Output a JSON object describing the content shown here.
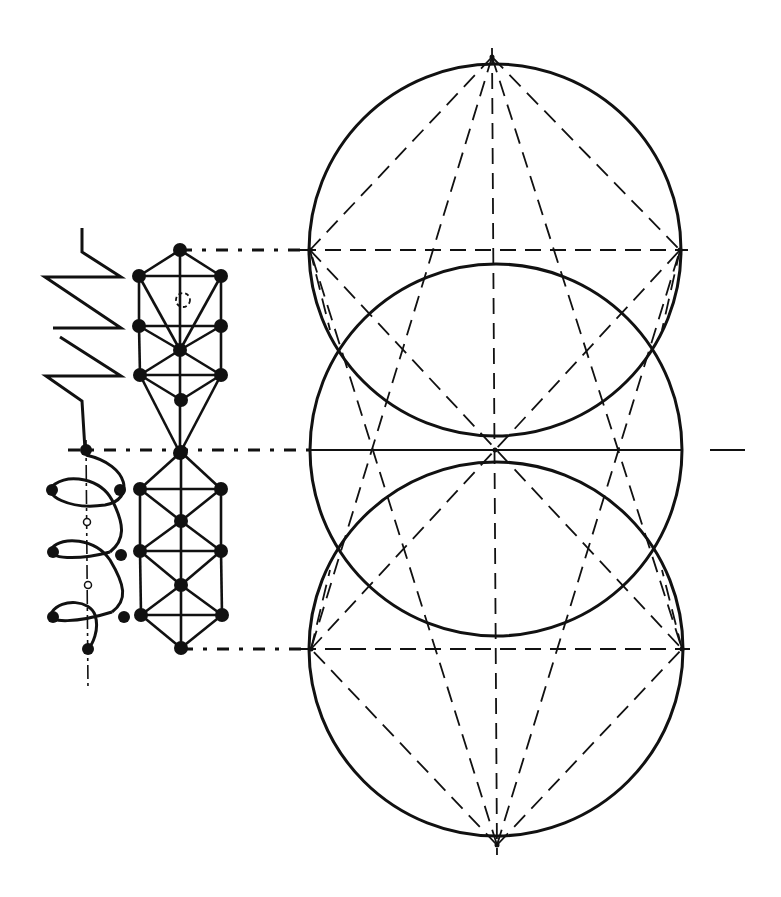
{
  "diagram": {
    "width": 781,
    "height": 897,
    "background": "#ffffff",
    "ink": "#111111",
    "circles": [
      {
        "id": "top-circle",
        "cx": 495,
        "cy": 250,
        "r": 186
      },
      {
        "id": "middle-circle",
        "cx": 496,
        "cy": 450,
        "r": 186
      },
      {
        "id": "bottom-circle",
        "cx": 496,
        "cy": 649,
        "r": 187
      }
    ],
    "apexes": {
      "top": [
        492,
        57
      ],
      "bottom": [
        497,
        845
      ],
      "center": [
        495,
        450
      ],
      "top_left": [
        310,
        250
      ],
      "top_right": [
        680,
        250
      ],
      "bottom_left": [
        311,
        649
      ],
      "bottom_right": [
        682,
        649
      ]
    },
    "solid_lines": [
      {
        "from": [
          310,
          450
        ],
        "to": [
          682,
          450
        ]
      },
      {
        "from": [
          710,
          450
        ],
        "to": [
          745,
          450
        ]
      }
    ],
    "dashed_lines": [
      {
        "from": [
          300,
          250
        ],
        "to": [
          688,
          250
        ]
      },
      {
        "from": [
          300,
          649
        ],
        "to": [
          690,
          649
        ]
      },
      {
        "from": [
          492,
          48
        ],
        "to": [
          497,
          855
        ]
      },
      {
        "from": [
          492,
          57
        ],
        "to": [
          310,
          250
        ]
      },
      {
        "from": [
          492,
          57
        ],
        "to": [
          680,
          250
        ]
      },
      {
        "from": [
          497,
          845
        ],
        "to": [
          311,
          649
        ]
      },
      {
        "from": [
          497,
          845
        ],
        "to": [
          682,
          649
        ]
      },
      {
        "from": [
          492,
          57
        ],
        "to": [
          311,
          649
        ]
      },
      {
        "from": [
          492,
          57
        ],
        "to": [
          682,
          649
        ]
      },
      {
        "from": [
          497,
          845
        ],
        "to": [
          310,
          250
        ]
      },
      {
        "from": [
          497,
          845
        ],
        "to": [
          680,
          250
        ]
      },
      {
        "from": [
          310,
          250
        ],
        "to": [
          682,
          649
        ]
      },
      {
        "from": [
          311,
          649
        ],
        "to": [
          680,
          250
        ]
      },
      {
        "from": [
          310,
          250
        ],
        "to": [
          330,
          330
        ]
      },
      {
        "from": [
          680,
          250
        ],
        "to": [
          662,
          330
        ]
      },
      {
        "from": [
          311,
          649
        ],
        "to": [
          330,
          570
        ]
      },
      {
        "from": [
          682,
          649
        ],
        "to": [
          662,
          570
        ]
      }
    ],
    "leader_lines": [
      {
        "from": [
          180,
          250
        ],
        "to": [
          310,
          250
        ]
      },
      {
        "from": [
          68,
          450
        ],
        "to": [
          310,
          450
        ]
      },
      {
        "from": [
          181,
          649
        ],
        "to": [
          311,
          649
        ]
      }
    ],
    "zigzag": {
      "points": [
        [
          82,
          228
        ],
        [
          82,
          252
        ],
        [
          121,
          277
        ],
        [
          45,
          277
        ],
        [
          121,
          328
        ],
        [
          53,
          328
        ]
      ],
      "points2": [
        [
          60,
          337
        ],
        [
          121,
          376
        ],
        [
          46,
          376
        ],
        [
          82,
          401
        ],
        [
          85,
          450
        ]
      ]
    },
    "upper_lattice": {
      "nodes": [
        [
          180,
          250
        ],
        [
          139,
          276
        ],
        [
          221,
          276
        ],
        [
          139,
          326
        ],
        [
          221,
          326
        ],
        [
          180,
          350
        ],
        [
          140,
          375
        ],
        [
          221,
          375
        ],
        [
          181,
          400
        ],
        [
          180,
          453
        ]
      ],
      "dashed_node": [
        183,
        300
      ],
      "edges": [
        [
          0,
          1
        ],
        [
          0,
          2
        ],
        [
          1,
          2
        ],
        [
          1,
          3
        ],
        [
          2,
          4
        ],
        [
          3,
          4
        ],
        [
          1,
          5
        ],
        [
          2,
          5
        ],
        [
          3,
          5
        ],
        [
          4,
          5
        ],
        [
          5,
          6
        ],
        [
          5,
          7
        ],
        [
          3,
          6
        ],
        [
          4,
          7
        ],
        [
          6,
          7
        ],
        [
          6,
          8
        ],
        [
          7,
          8
        ],
        [
          6,
          9
        ],
        [
          7,
          9
        ],
        [
          0,
          9
        ]
      ]
    },
    "lower_lattice": {
      "nodes": [
        [
          181,
          452
        ],
        [
          140,
          489
        ],
        [
          221,
          489
        ],
        [
          181,
          521
        ],
        [
          140,
          551
        ],
        [
          221,
          551
        ],
        [
          181,
          585
        ],
        [
          141,
          615
        ],
        [
          222,
          615
        ],
        [
          181,
          648
        ]
      ],
      "edges": [
        [
          0,
          1
        ],
        [
          0,
          2
        ],
        [
          1,
          2
        ],
        [
          1,
          3
        ],
        [
          2,
          3
        ],
        [
          1,
          4
        ],
        [
          2,
          5
        ],
        [
          3,
          4
        ],
        [
          3,
          5
        ],
        [
          4,
          5
        ],
        [
          4,
          6
        ],
        [
          5,
          6
        ],
        [
          4,
          7
        ],
        [
          5,
          8
        ],
        [
          6,
          7
        ],
        [
          6,
          8
        ],
        [
          7,
          8
        ],
        [
          7,
          9
        ],
        [
          8,
          9
        ],
        [
          0,
          9
        ]
      ]
    },
    "helix": {
      "axis": {
        "from": [
          86,
          440
        ],
        "to": [
          88,
          690
        ]
      },
      "axis_nodes": [
        [
          86,
          450
        ],
        [
          88,
          649
        ]
      ],
      "open_nodes": [
        [
          87,
          522
        ],
        [
          88,
          585
        ]
      ],
      "left_nodes": [
        [
          52,
          490
        ],
        [
          53,
          552
        ],
        [
          53,
          617
        ]
      ],
      "right_nodes": [
        [
          120,
          490
        ],
        [
          121,
          555
        ],
        [
          124,
          617
        ]
      ]
    }
  }
}
